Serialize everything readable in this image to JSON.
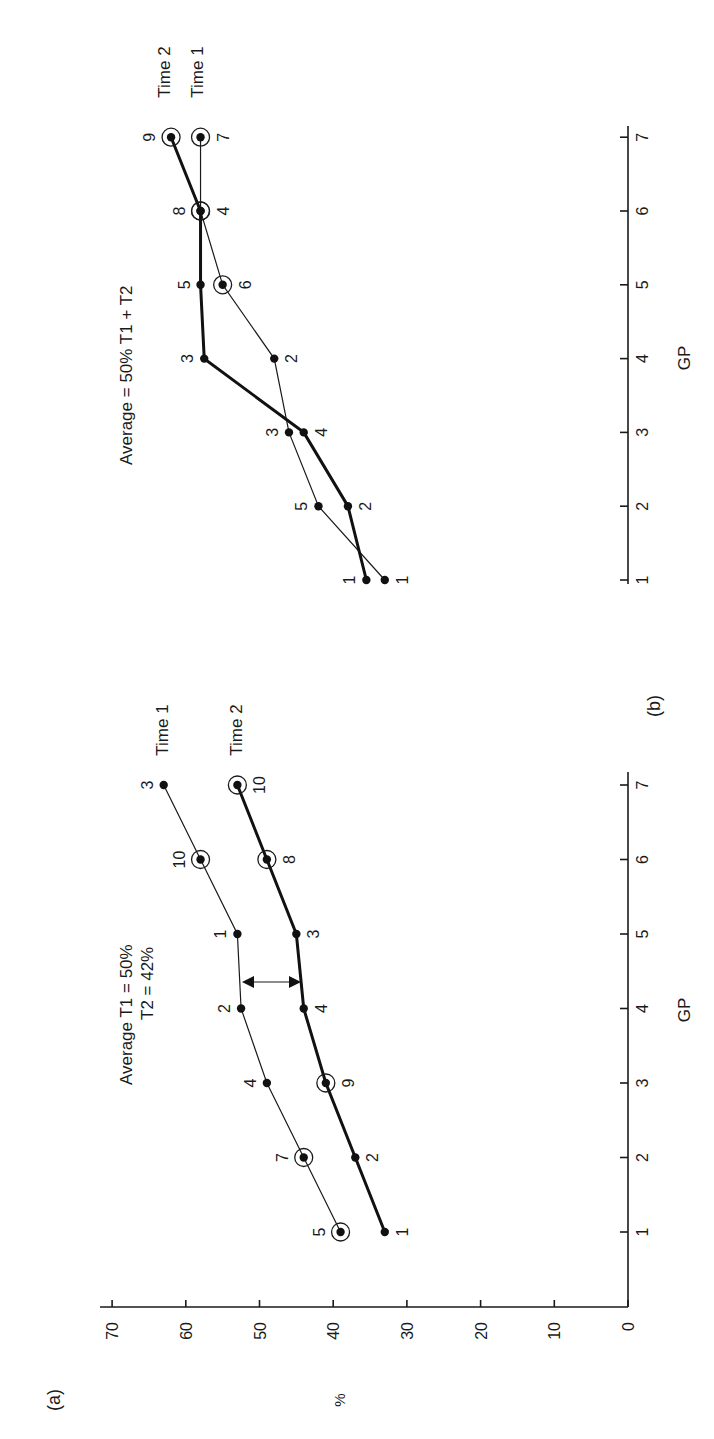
{
  "chart_data": [
    {
      "panel": "(a)",
      "type": "line",
      "title": "",
      "annotation": [
        "Average T1 = 50%",
        "T2 = 42%"
      ],
      "xlabel": "GP",
      "ylabel": "%",
      "x": [
        1,
        2,
        3,
        4,
        5,
        6,
        7
      ],
      "x_ticks": [
        "1",
        "2",
        "3",
        "4",
        "5",
        "6",
        "7"
      ],
      "y_ticks": [
        "0",
        "10",
        "20",
        "30",
        "40",
        "50",
        "60",
        "70"
      ],
      "ylim": [
        0,
        70
      ],
      "grid": false,
      "rotation": "figure rotated 90° counter-clockwise",
      "series": [
        {
          "name": "Time 1",
          "style": "thin",
          "values": [
            39,
            44,
            49,
            52.5,
            53,
            58,
            63
          ],
          "point_labels": [
            "5",
            "7",
            "4",
            "2",
            "1",
            "10",
            "3"
          ],
          "circled": [
            true,
            true,
            false,
            false,
            false,
            true,
            false
          ]
        },
        {
          "name": "Time 2",
          "style": "thick",
          "values": [
            33,
            37,
            41,
            44,
            45,
            49,
            53
          ],
          "point_labels": [
            "1",
            "2",
            "9",
            "4",
            "3",
            "8",
            "10"
          ],
          "circled": [
            false,
            false,
            true,
            false,
            false,
            true,
            true
          ]
        }
      ],
      "arrow": {
        "between_gp": 4.3,
        "from": 53,
        "to": 44.5,
        "style": "double-headed"
      }
    },
    {
      "panel": "(b)",
      "type": "line",
      "title": "",
      "annotation": [
        "Average = 50% T1 + T2"
      ],
      "xlabel": "GP",
      "ylabel": "",
      "x": [
        1,
        2,
        3,
        4,
        5,
        6,
        7
      ],
      "x_ticks": [
        "1",
        "2",
        "3",
        "4",
        "5",
        "6",
        "7"
      ],
      "grid": false,
      "series": [
        {
          "name": "Time 1",
          "style": "thin",
          "values": [
            33,
            42,
            46,
            48,
            55,
            58,
            58
          ],
          "point_labels": [
            "1",
            "5",
            "3",
            "2",
            "6",
            "4",
            "7"
          ],
          "circled": [
            false,
            false,
            false,
            false,
            true,
            true,
            true
          ]
        },
        {
          "name": "Time 2",
          "style": "thick",
          "values": [
            35.5,
            38,
            44,
            57.5,
            58,
            58,
            62
          ],
          "point_labels": [
            "1",
            "2",
            "4",
            "3",
            "5",
            "8",
            "9"
          ],
          "circled": [
            false,
            false,
            false,
            false,
            false,
            true,
            true
          ]
        }
      ]
    }
  ],
  "labels": {
    "panel_a": "(a)",
    "panel_b": "(b)",
    "y_axis": "%",
    "x_axis_a": "GP",
    "x_axis_b": "GP",
    "note_a_line1": "Average T1 = 50%",
    "note_a_line2": "T2 = 42%",
    "note_b": "Average = 50% T1 + T2",
    "time1": "Time 1",
    "time2": "Time 2"
  }
}
